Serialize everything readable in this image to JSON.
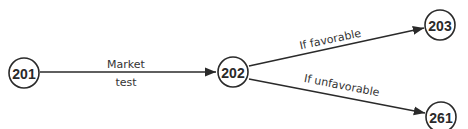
{
  "diagram": {
    "type": "decision-network",
    "nodes": [
      {
        "id": "201",
        "label": "201"
      },
      {
        "id": "202",
        "label": "202"
      },
      {
        "id": "203",
        "label": "203"
      },
      {
        "id": "261",
        "label": "261"
      }
    ],
    "edges": [
      {
        "from": "201",
        "to": "202",
        "label_above": "Market",
        "label_below": "test"
      },
      {
        "from": "202",
        "to": "203",
        "label": "If favorable"
      },
      {
        "from": "202",
        "to": "261",
        "label": "If unfavorable"
      }
    ],
    "colors": {
      "stroke": "#2a2a2a",
      "text": "#333333",
      "background": "#ffffff"
    }
  }
}
